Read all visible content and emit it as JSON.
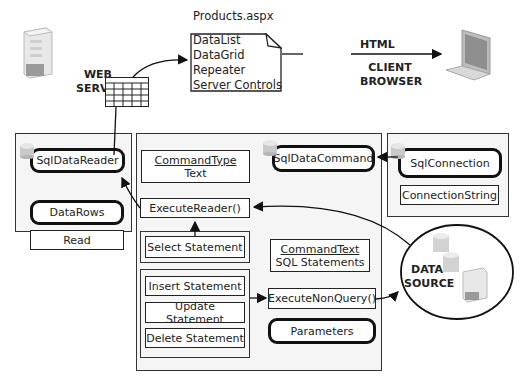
{
  "web_server": {
    "label_line1": "WEB",
    "label_line2": "SERVER"
  },
  "page_file": {
    "title": "Products.aspx",
    "items": [
      "DataList",
      "DataGrid",
      "Repeater",
      "Server Controls"
    ]
  },
  "html_arrow": {
    "label": "HTML"
  },
  "client": {
    "label_line1": "CLIENT",
    "label_line2": "BROWSER"
  },
  "reader_panel": {
    "title": "SqlDataReader",
    "datarows": "DataRows",
    "read": "Read"
  },
  "command_panel": {
    "title": "SqlDataCommand",
    "command_type": {
      "heading": "CommandType",
      "value": "Text"
    },
    "execute_reader": "ExecuteReader()",
    "select_statement": "Select Statement",
    "command_text": {
      "heading": "CommandText",
      "value": "SQL Statements"
    },
    "insert_statement": "Insert Statement",
    "update_statement": "Update Statement",
    "delete_statement": "Delete Statement",
    "execute_nonquery": "ExecuteNonQuery()",
    "parameters": "Parameters"
  },
  "connection_panel": {
    "title": "SqlConnection",
    "connection_string": "ConnectionString"
  },
  "data_source": {
    "label_line1": "DATA",
    "label_line2": "SOURCE"
  }
}
